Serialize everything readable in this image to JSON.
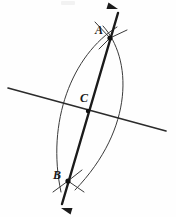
{
  "figure": {
    "background_color": "#fefefe",
    "ink_color": "#1b1b1b",
    "arc_color": "#3a3a3a",
    "width": 176,
    "height": 217,
    "labels": [
      {
        "id": "A",
        "text": "A",
        "x": 99,
        "y": 31
      },
      {
        "id": "C",
        "text": "C",
        "x": 84,
        "y": 99
      },
      {
        "id": "B",
        "text": "B",
        "x": 57,
        "y": 176
      }
    ],
    "points": [
      {
        "id": "A",
        "x": 110,
        "y": 38,
        "radius": 2.6
      },
      {
        "id": "C",
        "x": 88,
        "y": 111,
        "radius": 2.2
      },
      {
        "id": "B",
        "x": 68,
        "y": 181,
        "radius": 2.6
      }
    ],
    "segments": [
      {
        "id": "given-line",
        "name": "horizontal-given-line",
        "x1": 8,
        "y1": 88,
        "x2": 166,
        "y2": 131,
        "weight": "thin"
      },
      {
        "id": "bisector-line",
        "name": "bisector-line-through-A-B",
        "x1": 118,
        "y1": 13,
        "x2": 62,
        "y2": 204,
        "weight": "thick",
        "arrow_start": true,
        "arrow_end": true
      }
    ],
    "arcs": [
      {
        "id": "left-arc",
        "name": "compass-arc-left",
        "path": "M 117 27 C 72 55, 46 122, 61 192"
      },
      {
        "id": "right-arc",
        "name": "compass-arc-right",
        "path": "M 103 26 C 132 58, 135 128, 75 190"
      }
    ],
    "arc_tails": [
      {
        "id": "tail-A-upper-left",
        "x1": 95,
        "y1": 22,
        "x2": 110,
        "y2": 38
      },
      {
        "id": "tail-A-upper-right",
        "x1": 127,
        "y1": 30,
        "x2": 110,
        "y2": 38
      },
      {
        "id": "tail-A-lower-left",
        "x1": 99,
        "y1": 49,
        "x2": 110,
        "y2": 38
      },
      {
        "id": "tail-B-lower-left",
        "x1": 53,
        "y1": 192,
        "x2": 68,
        "y2": 181
      },
      {
        "id": "tail-B-lower-right",
        "x1": 84,
        "y1": 192,
        "x2": 68,
        "y2": 181
      },
      {
        "id": "tail-B-upper-right",
        "x1": 82,
        "y1": 170,
        "x2": 68,
        "y2": 181
      }
    ],
    "arrowheads": [
      {
        "id": "arrow-top",
        "name": "arrowhead-top",
        "tip_x": 118,
        "tip_y": 9,
        "angle": -163
      },
      {
        "id": "arrow-bottom",
        "name": "arrowhead-bottom",
        "tip_x": 61,
        "tip_y": 208,
        "angle": 17
      }
    ]
  }
}
